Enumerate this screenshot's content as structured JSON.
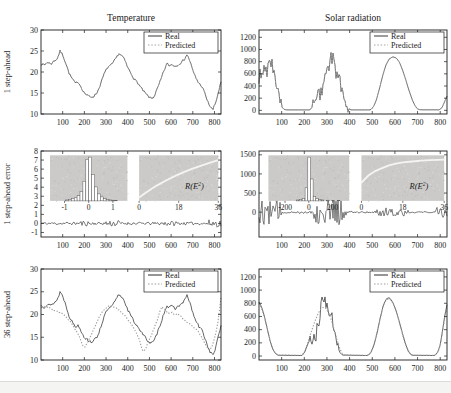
{
  "figure": {
    "column_titles": [
      "Temperature",
      "Solar radiation"
    ],
    "legend_labels": [
      "Real",
      "Predicted"
    ],
    "colors": {
      "real_line": "#4a4a4a",
      "predicted_line": "#a6a6a6",
      "error_line": "#2e2e2e",
      "axis": "#1c1c1c",
      "inset_bg": "#cbcac8",
      "inset_curve": "#f4f4f2",
      "hist_bar_fill": "#ffffff",
      "hist_bar_stroke": "#5a5a5a",
      "bottom_strip": "#f4f4f3",
      "bottom_rule": "#dcdcda"
    }
  },
  "chart_data": {
    "type": "line",
    "waveforms": {
      "temp_real": [
        0,
        22,
        15,
        21.6,
        30,
        22.4,
        45,
        21.9,
        60,
        22.6,
        75,
        23.2,
        88,
        25,
        100,
        24.1,
        115,
        22,
        130,
        19.6,
        145,
        18.3,
        160,
        17.2,
        172,
        17.7,
        185,
        16.4,
        200,
        15,
        215,
        14.4,
        230,
        14,
        245,
        14.3,
        260,
        15.2,
        275,
        17.2,
        290,
        19.4,
        305,
        21,
        318,
        21.4,
        330,
        22,
        345,
        23.2,
        358,
        24.4,
        372,
        23.9,
        385,
        23,
        400,
        21,
        415,
        19.7,
        430,
        18.3,
        445,
        17.5,
        460,
        16.3,
        475,
        15.3,
        490,
        14.4,
        505,
        13.7,
        520,
        14,
        535,
        15.8,
        550,
        17.8,
        565,
        20,
        580,
        22,
        592,
        21.5,
        605,
        21.8,
        620,
        21.3,
        635,
        21.9,
        650,
        22.4,
        662,
        23.1,
        672,
        24.2,
        685,
        22.9,
        700,
        20.3,
        715,
        18.5,
        728,
        17.3,
        742,
        16.6,
        755,
        15,
        768,
        13,
        780,
        11.8,
        792,
        11,
        805,
        12.6,
        818,
        15.2,
        830,
        17.6
      ],
      "solar_real": [
        0,
        520,
        8,
        640,
        16,
        470,
        24,
        760,
        32,
        580,
        40,
        740,
        50,
        800,
        60,
        700,
        70,
        540,
        80,
        330,
        90,
        160,
        100,
        60,
        110,
        18,
        120,
        8,
        225,
        8,
        238,
        70,
        252,
        160,
        266,
        260,
        280,
        360,
        294,
        520,
        308,
        700,
        320,
        870,
        330,
        820,
        340,
        560,
        350,
        580,
        360,
        440,
        370,
        300,
        380,
        150,
        390,
        55,
        400,
        15,
        408,
        8,
        492,
        8,
        505,
        55,
        518,
        170,
        532,
        360,
        546,
        570,
        560,
        740,
        574,
        840,
        590,
        880,
        606,
        860,
        620,
        790,
        634,
        660,
        648,
        500,
        662,
        330,
        676,
        180,
        688,
        80,
        698,
        30,
        708,
        10,
        795,
        8,
        808,
        45,
        818,
        130,
        830,
        235
      ],
      "temp_pred36": [
        0,
        21.5,
        20,
        21.8,
        40,
        21.4,
        60,
        21,
        80,
        20.6,
        100,
        20.1,
        120,
        19.2,
        140,
        18.2,
        160,
        16.6,
        178,
        15,
        192,
        13.2,
        202,
        12.8,
        212,
        13.6,
        228,
        15.2,
        245,
        17,
        262,
        18.8,
        280,
        20.4,
        298,
        21.4,
        315,
        21.9,
        332,
        21.7,
        350,
        21.3,
        368,
        20.6,
        385,
        19.8,
        402,
        18.8,
        420,
        17.6,
        438,
        16.2,
        452,
        14.6,
        464,
        12.8,
        472,
        11.7,
        482,
        12.4,
        494,
        13.8,
        508,
        15.4,
        522,
        17,
        536,
        18.8,
        548,
        20.6,
        558,
        21.7,
        568,
        21.3,
        580,
        20.7,
        592,
        20.2,
        605,
        20.4,
        618,
        19.9,
        632,
        20.1,
        645,
        19.6,
        658,
        18.9,
        672,
        18.3,
        686,
        17.9,
        700,
        17.4,
        714,
        16.8,
        728,
        16,
        742,
        14.9,
        756,
        13.6,
        768,
        12.6,
        778,
        12.1,
        788,
        12.9,
        798,
        14.4,
        808,
        16.4,
        818,
        19,
        830,
        23.8
      ],
      "solar36_real": [
        0,
        820,
        12,
        740,
        24,
        600,
        36,
        420,
        48,
        240,
        60,
        110,
        72,
        40,
        84,
        12,
        190,
        8,
        202,
        60,
        215,
        180,
        228,
        260,
        240,
        210,
        252,
        340,
        264,
        520,
        276,
        760,
        288,
        900,
        298,
        760,
        308,
        560,
        318,
        650,
        328,
        430,
        338,
        260,
        348,
        130,
        358,
        50,
        368,
        15,
        478,
        8,
        492,
        40,
        506,
        150,
        520,
        330,
        534,
        560,
        548,
        760,
        562,
        870,
        576,
        885,
        590,
        820,
        604,
        700,
        618,
        540,
        632,
        360,
        646,
        190,
        658,
        85,
        668,
        30,
        678,
        12,
        775,
        8,
        788,
        50,
        800,
        170,
        810,
        380,
        820,
        610,
        830,
        780
      ],
      "solar36_pred": [
        0,
        800,
        12,
        720,
        24,
        590,
        36,
        420,
        48,
        250,
        60,
        120,
        72,
        45,
        84,
        15,
        190,
        12,
        204,
        90,
        218,
        230,
        232,
        380,
        246,
        520,
        260,
        640,
        272,
        710,
        284,
        740,
        296,
        720,
        308,
        650,
        320,
        540,
        332,
        400,
        344,
        250,
        356,
        120,
        366,
        45,
        376,
        15,
        478,
        10,
        492,
        45,
        506,
        155,
        520,
        335,
        534,
        555,
        548,
        750,
        562,
        855,
        576,
        870,
        590,
        810,
        604,
        690,
        618,
        530,
        632,
        350,
        646,
        185,
        658,
        80,
        668,
        28,
        678,
        11,
        775,
        10,
        788,
        45,
        800,
        160,
        810,
        360,
        820,
        580,
        830,
        750
      ],
      "flat": [
        0,
        0,
        830,
        0
      ]
    },
    "panels": [
      {
        "id": "temperature-1-step",
        "col": 0,
        "row": 0,
        "title": "Temperature",
        "ylabel": "1 step-ahead",
        "xlim": [
          0,
          830
        ],
        "ylim": [
          10,
          30
        ],
        "xticks": [
          100,
          200,
          300,
          400,
          500,
          600,
          700,
          800
        ],
        "yticks": [
          10,
          15,
          20,
          25,
          30
        ],
        "legend": true,
        "series": [
          {
            "name": "Real",
            "data": "temp_real",
            "color": "#4a4a4a",
            "w": 0.8,
            "dash": "",
            "seed": 7,
            "noise": [
              [
                0,
                830,
                0.28
              ]
            ]
          },
          {
            "name": "Predicted",
            "data": "temp_real",
            "color": "#a6a6a6",
            "w": 0.9,
            "dash": "1.2,1.7",
            "seed": 7,
            "noise": [
              [
                0,
                830,
                0.28
              ]
            ]
          }
        ]
      },
      {
        "id": "solar-1-step",
        "col": 1,
        "row": 0,
        "title": "Solar radiation",
        "ylabel": "",
        "xlim": [
          0,
          830
        ],
        "ylim": [
          -60,
          1320
        ],
        "xticks": [
          100,
          200,
          300,
          400,
          500,
          600,
          700,
          800
        ],
        "yticks": [
          0,
          200,
          400,
          600,
          800,
          1000,
          1200
        ],
        "legend": true,
        "series": [
          {
            "name": "Real",
            "data": "solar_real",
            "color": "#4a4a4a",
            "w": 0.8,
            "dash": "",
            "seed": 9,
            "noise": [
              [
                0,
                100,
                130
              ],
              [
                235,
                395,
                120
              ]
            ]
          },
          {
            "name": "Predicted",
            "data": "solar_real",
            "color": "#a6a6a6",
            "w": 0.9,
            "dash": "1.2,1.7",
            "seed": 9,
            "noise": [
              [
                0,
                100,
                130
              ],
              [
                235,
                395,
                120
              ]
            ]
          }
        ]
      },
      {
        "id": "temperature-1-step-error",
        "col": 0,
        "row": 1,
        "title": "",
        "ylabel": "1 step-ahead error",
        "xlim": [
          0,
          830
        ],
        "ylim": [
          -1.5,
          8
        ],
        "xticks": [
          100,
          200,
          300,
          400,
          500,
          600,
          700,
          800
        ],
        "yticks": [
          -1,
          0,
          1,
          2,
          3,
          4,
          5,
          6,
          7,
          8
        ],
        "legend": false,
        "series": [
          {
            "name": "error",
            "data": "flat",
            "color": "#2e2e2e",
            "w": 0.6,
            "dash": "",
            "seed": 11,
            "noise": [
              [
                0,
                830,
                0.16
              ],
              [
                175,
                235,
                0.3
              ],
              [
                295,
                365,
                0.36
              ],
              [
                545,
                625,
                0.28
              ],
              [
                770,
                830,
                0.42
              ]
            ]
          }
        ],
        "insets": {
          "hist": {
            "xlim": [
              -1.6,
              1.6
            ],
            "xticks": [
              -1,
              0,
              1
            ],
            "barw": 0.12,
            "bars": [
              -0.9,
              0.02,
              -0.78,
              0.03,
              -0.66,
              0.05,
              -0.54,
              0.07,
              -0.42,
              0.12,
              -0.3,
              0.22,
              -0.18,
              0.45,
              -0.06,
              0.95,
              0.06,
              1.0,
              0.18,
              0.6,
              0.3,
              0.32,
              0.42,
              0.16,
              0.54,
              0.09,
              0.66,
              0.05,
              0.78,
              0.03,
              0.9,
              0.02,
              1.02,
              0.015,
              1.14,
              0.01
            ]
          },
          "curve": {
            "xlim": [
              0,
              36
            ],
            "xticks": [
              0,
              18,
              36
            ],
            "pts": [
              0,
              0.08,
              4,
              0.22,
              8,
              0.35,
              12,
              0.46,
              16,
              0.56,
              20,
              0.65,
              24,
              0.73,
              28,
              0.8,
              32,
              0.87,
              36,
              0.93
            ],
            "label": {
              "pre": "R(E",
              "sup": "2",
              "post": ")"
            }
          }
        }
      },
      {
        "id": "solar-1-step-error",
        "col": 1,
        "row": 1,
        "title": "",
        "ylabel": "",
        "xlim": [
          0,
          830
        ],
        "ylim": [
          -650,
          1600
        ],
        "xticks": [
          100,
          200,
          300,
          400,
          500,
          600,
          700,
          800
        ],
        "yticks": [
          0,
          500,
          1000,
          1500
        ],
        "legend": false,
        "series": [
          {
            "name": "error",
            "data": "flat",
            "color": "#2e2e2e",
            "w": 0.6,
            "dash": "",
            "seed": 12,
            "noise": [
              [
                0,
                100,
                330
              ],
              [
                100,
                240,
                35
              ],
              [
                240,
                300,
                300
              ],
              [
                300,
                385,
                380
              ],
              [
                385,
                510,
                25
              ],
              [
                510,
                575,
                120
              ],
              [
                575,
                660,
                100
              ],
              [
                660,
                780,
                22
              ],
              [
                780,
                830,
                140
              ]
            ]
          }
        ],
        "insets": {
          "hist": {
            "xlim": [
              -340,
              340
            ],
            "xticks": [
              -200,
              0,
              200
            ],
            "barw": 22,
            "bars": [
              -95,
              0.02,
              -70,
              0.03,
              -45,
              0.06,
              -20,
              0.3,
              2,
              1.0,
              25,
              0.5,
              48,
              0.1,
              70,
              0.05,
              92,
              0.03,
              115,
              0.02,
              160,
              0.015,
              205,
              0.012,
              250,
              0.01
            ]
          },
          "curve": {
            "xlim": [
              0,
              36
            ],
            "xticks": [
              0,
              18,
              36
            ],
            "pts": [
              0,
              0.42,
              3,
              0.58,
              6,
              0.68,
              9,
              0.75,
              12,
              0.81,
              15,
              0.85,
              18,
              0.88,
              22,
              0.9,
              26,
              0.92,
              30,
              0.93,
              36,
              0.94
            ],
            "label": {
              "pre": "R(E",
              "sup": "2",
              "post": ")"
            }
          }
        }
      },
      {
        "id": "temperature-36-step",
        "col": 0,
        "row": 2,
        "title": "",
        "ylabel": "36 step-ahead",
        "xlim": [
          0,
          830
        ],
        "ylim": [
          10,
          30
        ],
        "xticks": [
          100,
          200,
          300,
          400,
          500,
          600,
          700,
          800
        ],
        "yticks": [
          10,
          15,
          20,
          25,
          30
        ],
        "legend": true,
        "series": [
          {
            "name": "Real",
            "data": "temp_real",
            "color": "#3f3f3f",
            "w": 0.8,
            "dash": "",
            "seed": 13,
            "noise": [
              [
                0,
                830,
                0.3
              ]
            ]
          },
          {
            "name": "Predicted",
            "data": "temp_pred36",
            "color": "#9c9c9c",
            "w": 1.1,
            "dash": "1.3,1.7",
            "seed": 14,
            "noise": [
              [
                0,
                830,
                0.12
              ]
            ]
          }
        ]
      },
      {
        "id": "solar-36-step",
        "col": 1,
        "row": 2,
        "title": "",
        "ylabel": "",
        "xlim": [
          0,
          830
        ],
        "ylim": [
          -60,
          1320
        ],
        "xticks": [
          100,
          200,
          300,
          400,
          500,
          600,
          700,
          800
        ],
        "yticks": [
          0,
          200,
          400,
          600,
          800,
          1000,
          1200
        ],
        "legend": true,
        "series": [
          {
            "name": "Real",
            "data": "solar36_real",
            "color": "#3f3f3f",
            "w": 0.8,
            "dash": "",
            "seed": 15,
            "noise": [
              [
                225,
                350,
                115
              ]
            ]
          },
          {
            "name": "Predicted",
            "data": "solar36_pred",
            "color": "#9c9c9c",
            "w": 1.1,
            "dash": "1.3,1.7",
            "seed": 16,
            "noise": []
          }
        ]
      }
    ]
  }
}
